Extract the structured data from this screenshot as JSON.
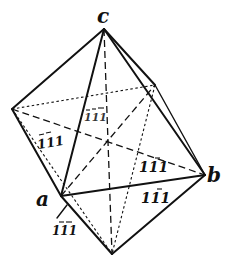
{
  "figure": {
    "vertex_labels": {
      "top": "c",
      "right": "b",
      "front_left": "a"
    },
    "face_labels": [
      {
        "id": "back-upper",
        "text": "111",
        "bars": [
          true,
          true,
          true
        ],
        "style": "dotted"
      },
      {
        "id": "left-upper",
        "text": "111",
        "bars": [
          true,
          true,
          false
        ]
      },
      {
        "id": "right-upper",
        "text": "111",
        "bars": [
          false,
          false,
          true
        ]
      },
      {
        "id": "front-lower",
        "text": "111",
        "bars": [
          false,
          false,
          true
        ]
      },
      {
        "id": "under-a",
        "text": "111",
        "bars": [
          false,
          true,
          true
        ]
      }
    ],
    "vertices": {
      "top": [
        104,
        29
      ],
      "left": [
        12,
        109
      ],
      "back_right": [
        155,
        85
      ],
      "right": [
        205,
        175
      ],
      "front_left": [
        61,
        196
      ],
      "bottom": [
        112,
        254
      ],
      "center": [
        107,
        140
      ]
    },
    "colors": {
      "line": "#111111",
      "background": "#ffffff"
    }
  }
}
